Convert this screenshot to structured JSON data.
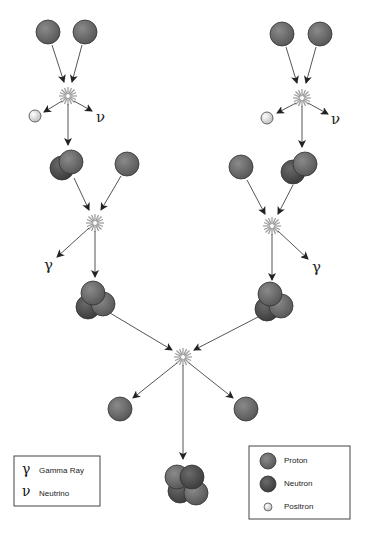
{
  "diagram": {
    "symbols": {
      "gamma": "γ",
      "neutrino": "ν"
    },
    "legend_symbols": {
      "title": "Symbols",
      "items": [
        {
          "symbol": "γ",
          "label": "Gamma Ray"
        },
        {
          "symbol": "ν",
          "label": "Neutrino"
        }
      ]
    },
    "legend_particles": {
      "items": [
        {
          "particle": "proton",
          "label": "Proton"
        },
        {
          "particle": "neutron",
          "label": "Neutron"
        },
        {
          "particle": "positron",
          "label": "Positron"
        }
      ]
    },
    "colors": {
      "proton": "#6b6b6b",
      "neutron": "#4a4a4a",
      "positron": "#f4f4f4",
      "arrow": "#555555",
      "border": "#444444"
    },
    "steps": [
      {
        "stage": "1",
        "inputs": [
          "proton",
          "proton"
        ],
        "outputs": [
          "deuterium",
          "positron",
          "neutrino"
        ]
      },
      {
        "stage": "2",
        "inputs": [
          "deuterium",
          "proton"
        ],
        "outputs": [
          "helium-3",
          "gamma ray"
        ]
      },
      {
        "stage": "3",
        "inputs": [
          "helium-3",
          "helium-3"
        ],
        "outputs": [
          "helium-4",
          "proton",
          "proton"
        ]
      }
    ]
  }
}
